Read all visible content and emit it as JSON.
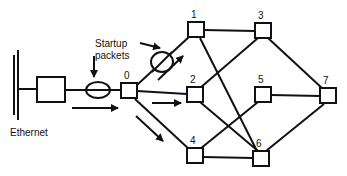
{
  "diagram": {
    "labels": {
      "ethernet": "Ethernet",
      "startup_line1": "Startup",
      "startup_line2": "packets"
    },
    "nodes": [
      {
        "id": "0",
        "x": 121,
        "y": 83
      },
      {
        "id": "1",
        "x": 188,
        "y": 22
      },
      {
        "id": "2",
        "x": 187,
        "y": 87
      },
      {
        "id": "3",
        "x": 255,
        "y": 23
      },
      {
        "id": "4",
        "x": 187,
        "y": 148
      },
      {
        "id": "5",
        "x": 255,
        "y": 87
      },
      {
        "id": "6",
        "x": 253,
        "y": 151
      },
      {
        "id": "7",
        "x": 320,
        "y": 88
      }
    ],
    "edges": [
      [
        "0",
        "1"
      ],
      [
        "0",
        "2"
      ],
      [
        "0",
        "4"
      ],
      [
        "1",
        "3"
      ],
      [
        "1",
        "6"
      ],
      [
        "2",
        "3"
      ],
      [
        "2",
        "6"
      ],
      [
        "4",
        "5"
      ],
      [
        "4",
        "6"
      ],
      [
        "3",
        "7"
      ],
      [
        "5",
        "7"
      ],
      [
        "6",
        "7"
      ]
    ],
    "colors": {
      "stroke": "#111111",
      "background": "#ffffff"
    }
  }
}
